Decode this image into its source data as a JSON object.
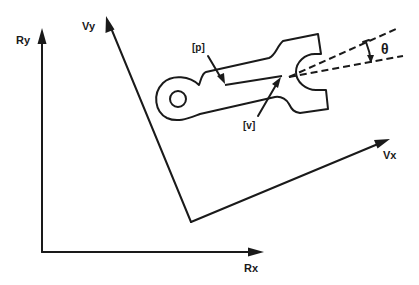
{
  "diagram": {
    "colors": {
      "ink": "#1a1a1a",
      "background": "#ffffff"
    },
    "robot_frame": {
      "x_label": "Rx",
      "y_label": "Ry"
    },
    "vision_frame": {
      "x_label": "Vx",
      "y_label": "Vy"
    },
    "part": {
      "position_label": "[p]",
      "vector_label": "[v]",
      "angle_label": "θ"
    }
  }
}
